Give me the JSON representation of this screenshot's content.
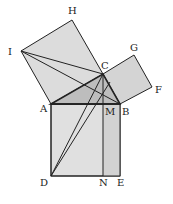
{
  "figure": {
    "points": {
      "H": [
        72,
        20
      ],
      "I": [
        21,
        51
      ],
      "C": [
        103,
        74
      ],
      "G": [
        134,
        55
      ],
      "F": [
        152,
        87
      ],
      "A": [
        51,
        104
      ],
      "B": [
        120,
        104
      ],
      "M": [
        103,
        104
      ],
      "D": [
        51,
        176
      ],
      "N": [
        103,
        176
      ],
      "E": [
        120,
        176
      ]
    },
    "labels": {
      "H": "H",
      "I": "I",
      "C": "C",
      "G": "G",
      "F": "F",
      "A": "A",
      "B": "B",
      "M": "M",
      "D": "D",
      "N": "N",
      "E": "E"
    },
    "colors": {
      "fill_large_square": "#d8d8d8",
      "fill_triangle": "#bdbdbd",
      "stroke": "#222222"
    }
  }
}
